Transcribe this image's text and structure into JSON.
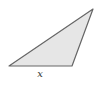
{
  "diagram": {
    "shape": "triangle",
    "vertices": [
      [
        9,
        66
      ],
      [
        72,
        66
      ],
      [
        93,
        9
      ]
    ],
    "fill": "#e6e6e6",
    "stroke": "#666666",
    "labels": {
      "base": "x"
    }
  }
}
